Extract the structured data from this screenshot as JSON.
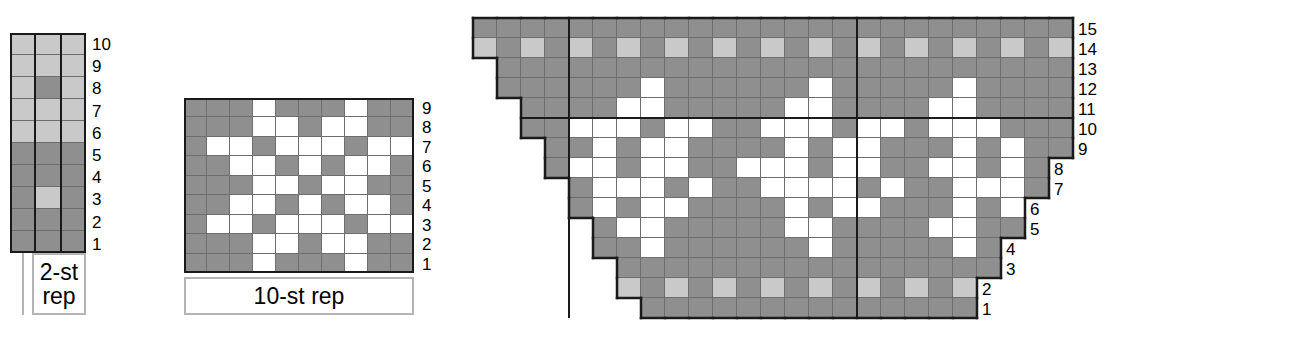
{
  "page": {
    "background": "#ffffff",
    "colors": {
      "dark_gray": "#8f8f8f",
      "light_gray": "#c9c9c9",
      "white": "#ffffff",
      "grid_line": "#6e6e6e",
      "heavy_line": "#1a1a1a",
      "rep_bracket": "#b4b4b4"
    }
  },
  "chart_data": [
    {
      "id": "chart-1",
      "type": "heatmap",
      "title": "",
      "caption": "2-st rep",
      "caption_lines": [
        "2-st",
        "rep"
      ],
      "columns": 3,
      "rows": 10,
      "row_labels": [
        "10",
        "9",
        "8",
        "7",
        "6",
        "5",
        "4",
        "3",
        "2",
        "1"
      ],
      "legend": {
        "L": "light gray",
        "D": "dark gray"
      },
      "cells_top_to_bottom": [
        [
          "L",
          "L",
          "L"
        ],
        [
          "L",
          "L",
          "L"
        ],
        [
          "L",
          "D",
          "L"
        ],
        [
          "L",
          "L",
          "L"
        ],
        [
          "L",
          "L",
          "L"
        ],
        [
          "D",
          "D",
          "D"
        ],
        [
          "D",
          "D",
          "D"
        ],
        [
          "D",
          "L",
          "D"
        ],
        [
          "D",
          "D",
          "D"
        ],
        [
          "D",
          "D",
          "D"
        ]
      ]
    },
    {
      "id": "chart-2",
      "type": "heatmap",
      "title": "",
      "caption": "10-st rep",
      "caption_lines": [
        "10-st rep"
      ],
      "columns": 10,
      "rows": 9,
      "row_labels": [
        "9",
        "8",
        "7",
        "6",
        "5",
        "4",
        "3",
        "2",
        "1"
      ],
      "legend": {
        "W": "white",
        "D": "dark gray"
      },
      "cells_top_to_bottom": [
        [
          "D",
          "D",
          "D",
          "W",
          "D",
          "D",
          "D",
          "W",
          "D",
          "D"
        ],
        [
          "D",
          "D",
          "D",
          "W",
          "W",
          "D",
          "W",
          "W",
          "D",
          "D"
        ],
        [
          "D",
          "W",
          "W",
          "D",
          "W",
          "W",
          "W",
          "D",
          "W",
          "W"
        ],
        [
          "D",
          "D",
          "W",
          "W",
          "D",
          "W",
          "D",
          "W",
          "W",
          "D"
        ],
        [
          "D",
          "D",
          "D",
          "W",
          "W",
          "D",
          "W",
          "W",
          "D",
          "D"
        ],
        [
          "D",
          "D",
          "W",
          "W",
          "D",
          "W",
          "D",
          "W",
          "W",
          "D"
        ],
        [
          "D",
          "W",
          "W",
          "D",
          "W",
          "W",
          "W",
          "D",
          "W",
          "W"
        ],
        [
          "D",
          "D",
          "D",
          "W",
          "W",
          "D",
          "W",
          "W",
          "D",
          "D"
        ],
        [
          "D",
          "D",
          "D",
          "W",
          "D",
          "D",
          "D",
          "W",
          "D",
          "D"
        ]
      ]
    },
    {
      "id": "chart-3",
      "type": "heatmap",
      "title": "",
      "caption": "",
      "columns": 25,
      "rows": 15,
      "row_labels_right": [
        "15",
        "14",
        "13",
        "12",
        "11",
        "10",
        "9",
        "8",
        "7",
        "6",
        "5",
        "4",
        "3",
        "2",
        "1"
      ],
      "legend": {
        "W": "white",
        "D": "dark gray",
        "L": "light gray",
        "X": "empty / no stitch"
      },
      "note": "Shaped (stair-stepped) chart: X marks cells outside the worked area.",
      "cells_top_to_bottom": [
        [
          "D",
          "D",
          "D",
          "D",
          "D",
          "D",
          "D",
          "D",
          "D",
          "D",
          "D",
          "D",
          "D",
          "D",
          "D",
          "D",
          "D",
          "D",
          "D",
          "D",
          "D",
          "D",
          "D",
          "D",
          "D"
        ],
        [
          "L",
          "D",
          "L",
          "D",
          "L",
          "D",
          "L",
          "D",
          "L",
          "D",
          "L",
          "D",
          "L",
          "D",
          "L",
          "D",
          "L",
          "D",
          "L",
          "D",
          "L",
          "D",
          "L",
          "D",
          "L"
        ],
        [
          "X",
          "D",
          "D",
          "D",
          "D",
          "D",
          "D",
          "D",
          "D",
          "D",
          "D",
          "D",
          "D",
          "D",
          "D",
          "D",
          "D",
          "D",
          "D",
          "D",
          "D",
          "D",
          "D",
          "D",
          "D"
        ],
        [
          "X",
          "D",
          "D",
          "D",
          "D",
          "D",
          "D",
          "W",
          "D",
          "D",
          "D",
          "D",
          "D",
          "D",
          "W",
          "D",
          "D",
          "D",
          "D",
          "D",
          "W",
          "D",
          "D",
          "D",
          "D"
        ],
        [
          "X",
          "X",
          "D",
          "D",
          "D",
          "D",
          "W",
          "W",
          "D",
          "D",
          "D",
          "D",
          "D",
          "W",
          "W",
          "D",
          "D",
          "D",
          "D",
          "W",
          "W",
          "D",
          "D",
          "D",
          "D"
        ],
        [
          "X",
          "X",
          "D",
          "D",
          "W",
          "W",
          "W",
          "D",
          "W",
          "W",
          "D",
          "D",
          "W",
          "W",
          "W",
          "D",
          "W",
          "W",
          "D",
          "W",
          "W",
          "W",
          "D",
          "D",
          "D"
        ],
        [
          "X",
          "X",
          "X",
          "D",
          "D",
          "W",
          "D",
          "W",
          "W",
          "D",
          "D",
          "D",
          "D",
          "W",
          "D",
          "W",
          "W",
          "D",
          "D",
          "D",
          "W",
          "D",
          "W",
          "D",
          "D"
        ],
        [
          "X",
          "X",
          "X",
          "D",
          "W",
          "W",
          "D",
          "W",
          "W",
          "D",
          "D",
          "W",
          "W",
          "W",
          "D",
          "W",
          "W",
          "D",
          "D",
          "W",
          "W",
          "D",
          "W",
          "D",
          "X"
        ],
        [
          "X",
          "X",
          "X",
          "X",
          "D",
          "W",
          "W",
          "W",
          "D",
          "W",
          "D",
          "D",
          "W",
          "W",
          "W",
          "W",
          "D",
          "W",
          "D",
          "D",
          "W",
          "W",
          "W",
          "D",
          "X"
        ],
        [
          "X",
          "X",
          "X",
          "X",
          "D",
          "W",
          "D",
          "W",
          "W",
          "D",
          "D",
          "D",
          "D",
          "W",
          "D",
          "W",
          "W",
          "D",
          "D",
          "D",
          "W",
          "D",
          "W",
          "X",
          "X"
        ],
        [
          "X",
          "X",
          "X",
          "X",
          "X",
          "D",
          "W",
          "W",
          "D",
          "D",
          "D",
          "D",
          "D",
          "W",
          "W",
          "D",
          "D",
          "D",
          "D",
          "W",
          "W",
          "D",
          "D",
          "X",
          "X"
        ],
        [
          "X",
          "X",
          "X",
          "X",
          "X",
          "D",
          "D",
          "W",
          "D",
          "D",
          "D",
          "D",
          "D",
          "D",
          "W",
          "D",
          "D",
          "D",
          "D",
          "D",
          "W",
          "D",
          "X",
          "X",
          "X"
        ],
        [
          "X",
          "X",
          "X",
          "X",
          "X",
          "X",
          "D",
          "D",
          "D",
          "D",
          "D",
          "D",
          "D",
          "D",
          "D",
          "D",
          "D",
          "D",
          "D",
          "D",
          "D",
          "D",
          "X",
          "X",
          "X"
        ],
        [
          "X",
          "X",
          "X",
          "X",
          "X",
          "X",
          "L",
          "D",
          "L",
          "D",
          "L",
          "D",
          "L",
          "D",
          "L",
          "D",
          "L",
          "D",
          "L",
          "D",
          "L",
          "X",
          "X",
          "X",
          "X"
        ],
        [
          "X",
          "X",
          "X",
          "X",
          "X",
          "X",
          "X",
          "D",
          "D",
          "D",
          "D",
          "D",
          "D",
          "D",
          "D",
          "D",
          "D",
          "D",
          "D",
          "D",
          "D",
          "X",
          "X",
          "X",
          "X"
        ]
      ]
    }
  ],
  "chart1": {
    "caption_line1": "2-st",
    "caption_line2": "rep",
    "row_numbers": [
      "10",
      "9",
      "8",
      "7",
      "6",
      "5",
      "4",
      "3",
      "2",
      "1"
    ]
  },
  "chart2": {
    "caption": "10-st rep",
    "row_numbers": [
      "9",
      "8",
      "7",
      "6",
      "5",
      "4",
      "3",
      "2",
      "1"
    ]
  },
  "chart3": {
    "row_numbers": [
      "15",
      "14",
      "13",
      "12",
      "11",
      "10",
      "9",
      "8",
      "7",
      "6",
      "5",
      "4",
      "3",
      "2",
      "1"
    ]
  }
}
